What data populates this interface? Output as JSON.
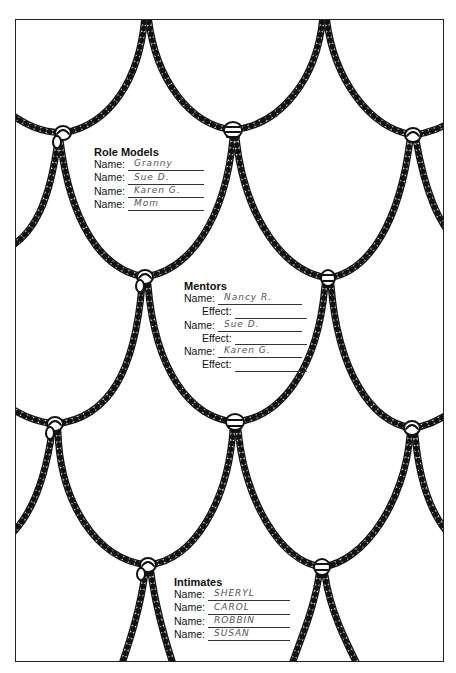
{
  "worksheet": {
    "role_models": {
      "title": "Role Models",
      "label": "Name:",
      "names": [
        "Granny",
        "Sue D.",
        "Karen G.",
        "Mom"
      ]
    },
    "mentors": {
      "title": "Mentors",
      "name_label": "Name:",
      "effect_label": "Effect:",
      "entries": [
        {
          "name": "Nancy R.",
          "effect": ""
        },
        {
          "name": "Sue D.",
          "effect": ""
        },
        {
          "name": "Karen G.",
          "effect": ""
        }
      ]
    },
    "intimates": {
      "title": "Intimates",
      "label": "Name:",
      "names": [
        "SHERYL",
        "CAROL",
        "ROBBIN",
        "SUSAN"
      ]
    }
  },
  "style": {
    "ink_color": "#111111",
    "handwriting_color": "#555555",
    "paper_color": "#ffffff"
  }
}
